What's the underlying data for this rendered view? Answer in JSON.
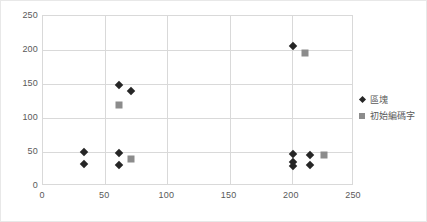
{
  "chart_data": {
    "type": "scatter",
    "title": "",
    "xlabel": "",
    "ylabel": "",
    "xlim": [
      0,
      250
    ],
    "ylim": [
      0,
      250
    ],
    "xticks": [
      0,
      50,
      100,
      150,
      200,
      250
    ],
    "yticks": [
      0,
      50,
      100,
      150,
      200,
      250
    ],
    "grid": true,
    "legend_position": "right",
    "series": [
      {
        "name": "區塊",
        "marker": "diamond",
        "color": "#262626",
        "points": [
          [
            33,
            50
          ],
          [
            33,
            32
          ],
          [
            61,
            149
          ],
          [
            71,
            139
          ],
          [
            61,
            49
          ],
          [
            61,
            31
          ],
          [
            201,
            206
          ],
          [
            201,
            47
          ],
          [
            201,
            36
          ],
          [
            201,
            29
          ],
          [
            215,
            46
          ],
          [
            215,
            31
          ]
        ]
      },
      {
        "name": "初始編碼字",
        "marker": "square",
        "color": "#8c8c8c",
        "points": [
          [
            61,
            119
          ],
          [
            71,
            39
          ],
          [
            211,
            196
          ],
          [
            226,
            46
          ]
        ]
      }
    ]
  },
  "legend": {
    "items": [
      {
        "label": "區塊",
        "marker": "diamond"
      },
      {
        "label": "初始編碼字",
        "marker": "square"
      }
    ]
  }
}
